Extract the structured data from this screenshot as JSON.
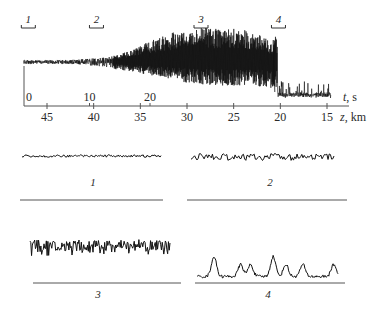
{
  "figure": {
    "colors": {
      "trace": "#111111",
      "axis": "#555555",
      "text": "#2a2a2a",
      "background": "#ffffff"
    }
  },
  "chart_data": [
    {
      "type": "line",
      "name": "main-record",
      "title": "",
      "description": "Signal record along the path: low-amplitude noise at start, growing strong spiky oscillations in the middle, decaying to small bursts at the end",
      "xaxis_top": {
        "label_var": "t",
        "label_unit": ", s",
        "ticks": [
          "0",
          "10",
          "20"
        ],
        "tick_values": [
          0,
          10,
          20
        ],
        "range": [
          0,
          40
        ]
      },
      "xaxis_bottom": {
        "label_var": "z",
        "label_unit": ", km",
        "ticks": [
          "45",
          "40",
          "35",
          "30",
          "25",
          "20",
          "15"
        ],
        "tick_values": [
          45,
          40,
          35,
          30,
          25,
          20,
          15
        ],
        "range": [
          48,
          14
        ]
      },
      "segment_markers": [
        {
          "label": "1",
          "z_center": 47
        },
        {
          "label": "2",
          "z_center": 39.7
        },
        {
          "label": "3",
          "z_center": 28.5
        },
        {
          "label": "4",
          "z_center": 20.2
        }
      ],
      "envelope": {
        "z": [
          48,
          45,
          42,
          40,
          38,
          36,
          34,
          32,
          30,
          28,
          26,
          24,
          22,
          21,
          20.5,
          20,
          19,
          18,
          17,
          16,
          15,
          14.5
        ],
        "upper": [
          0.05,
          0.05,
          0.06,
          0.1,
          0.15,
          0.3,
          0.55,
          0.75,
          0.85,
          0.9,
          0.9,
          0.85,
          0.7,
          0.5,
          0.7,
          0.25,
          0.15,
          0.1,
          0.08,
          0.08,
          0.06,
          0.03
        ],
        "lower": [
          -0.05,
          -0.05,
          -0.06,
          -0.12,
          -0.18,
          -0.25,
          -0.35,
          -0.45,
          -0.55,
          -0.6,
          -0.62,
          -0.64,
          -0.66,
          -0.68,
          -0.68,
          -0.7,
          -0.7,
          -0.7,
          -0.7,
          -0.7,
          -0.7,
          -0.7
        ]
      }
    },
    {
      "type": "line",
      "name": "segment-1",
      "label": "1",
      "description": "Small regular noise, nearly flat",
      "amplitude": 0.08
    },
    {
      "type": "line",
      "name": "segment-2",
      "label": "2",
      "description": "Moderate irregular oscillations",
      "amplitude": 0.35
    },
    {
      "type": "line",
      "name": "segment-3",
      "label": "3",
      "description": "Large spiky oscillations",
      "amplitude": 1.0
    },
    {
      "type": "line",
      "name": "segment-4",
      "label": "4",
      "description": "Isolated small peaks over quiet baseline",
      "amplitude": 0.4
    }
  ],
  "labels": {
    "t_var": "t",
    "t_unit": ", s",
    "z_var": "z",
    "z_unit": ", km",
    "panel_1": "1",
    "panel_2": "2",
    "panel_3": "3",
    "panel_4": "4"
  }
}
